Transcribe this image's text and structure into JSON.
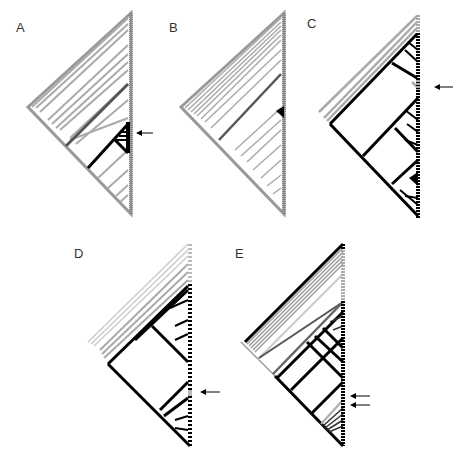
{
  "figure": {
    "panels": [
      {
        "id": "A",
        "label": "A",
        "arrows": 1,
        "style": "mostly gray tree with black clade near lower middle"
      },
      {
        "id": "B",
        "label": "B",
        "arrows": 0,
        "style": "mostly gray tree with small black clade"
      },
      {
        "id": "C",
        "label": "C",
        "arrows": 1,
        "style": "mostly black tree with gray outer clades"
      },
      {
        "id": "D",
        "label": "D",
        "arrows": 1,
        "style": "mostly black tree with gray upper clades"
      },
      {
        "id": "E",
        "label": "E",
        "arrows": 2,
        "style": "mixed black/gray dense tree"
      }
    ],
    "colors": {
      "black": "#000000",
      "dark_gray": "#555555",
      "mid_gray": "#888888",
      "light_gray": "#bbbbbb",
      "background": "#ffffff"
    }
  }
}
